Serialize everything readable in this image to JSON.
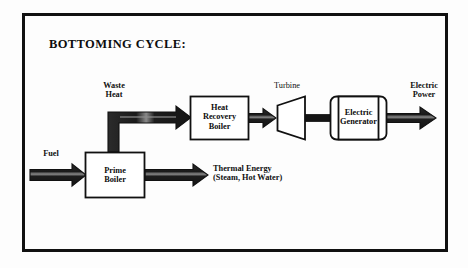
{
  "figure": {
    "title": "BOTTOMING CYCLE:",
    "border_color": "#111111",
    "background_color": "#fdfdfd",
    "arrow_color": "#1a1a1a",
    "shape_outline_color": "#111111",
    "shape_fill_color": "#ffffff"
  },
  "nodes": [
    {
      "id": "prime-boiler",
      "label_line1": "Prime",
      "label_line2": "Boiler",
      "label_line3": "",
      "shape": "rectangle"
    },
    {
      "id": "heat-recovery-boiler",
      "label_line1": "Heat",
      "label_line2": "Recovery",
      "label_line3": "Boiler",
      "shape": "rectangle"
    },
    {
      "id": "turbine",
      "label_line1": "Turbine",
      "label_line2": "",
      "label_line3": "",
      "shape": "trapezoid"
    },
    {
      "id": "electric-generator",
      "label_line1": "Electric",
      "label_line2": "Generator",
      "label_line3": "",
      "shape": "cylinder"
    }
  ],
  "flows": [
    {
      "id": "fuel",
      "label_line1": "Fuel",
      "label_line2": "",
      "direction": "right"
    },
    {
      "id": "waste-heat",
      "label_line1": "Waste",
      "label_line2": "Heat",
      "direction": "up-right"
    },
    {
      "id": "thermal-energy",
      "label_line1": "Thermal Energy",
      "label_line2": "(Steam, Hot Water)",
      "direction": "right"
    },
    {
      "id": "electric-power",
      "label_line1": "Electric",
      "label_line2": "Power",
      "direction": "right"
    }
  ]
}
